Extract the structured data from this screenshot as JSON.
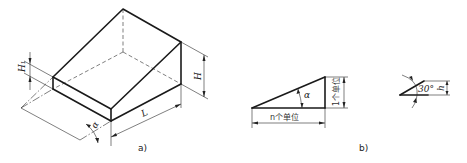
{
  "figure": {
    "panel_a": {
      "caption": "a)",
      "labels": {
        "height_small": "H₁",
        "height": "H",
        "length": "L",
        "angle": "α"
      }
    },
    "panel_b": {
      "caption": "b)",
      "labels": {
        "angle": "α",
        "base": "n个单位",
        "rise": "1个单位"
      }
    },
    "panel_c": {
      "labels": {
        "angle": "30°",
        "height": "h"
      }
    }
  }
}
